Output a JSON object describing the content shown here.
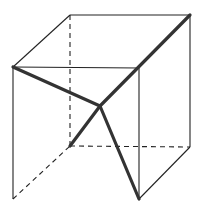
{
  "diagram": {
    "colors": {
      "background": "#ffffff",
      "edge": "#222222",
      "bold": "#333333"
    },
    "vertices": {
      "front_top_left": [
        13,
        67
      ],
      "front_top_right": [
        139,
        68
      ],
      "front_bottom_left": [
        13,
        199
      ],
      "front_bottom_right": [
        139,
        199
      ],
      "back_top_left": [
        70,
        15
      ],
      "back_top_right": [
        190,
        15
      ],
      "back_bottom_left": [
        70,
        146
      ],
      "back_bottom_right": [
        190,
        147
      ],
      "center": [
        100,
        106
      ]
    },
    "solid_edges": [
      [
        "front_top_left",
        "front_top_right"
      ],
      [
        "front_top_left",
        "front_bottom_left"
      ],
      [
        "front_top_right",
        "front_bottom_right"
      ],
      [
        "back_top_left",
        "back_top_right"
      ],
      [
        "back_top_right",
        "back_bottom_right"
      ],
      [
        "front_top_left",
        "back_top_left"
      ],
      [
        "front_bottom_right",
        "back_bottom_right"
      ]
    ],
    "dashed_edges": [
      [
        "back_top_left",
        "back_bottom_left"
      ],
      [
        "back_bottom_left",
        "back_bottom_right"
      ],
      [
        "front_bottom_left",
        "back_bottom_left"
      ]
    ],
    "bold_segments": [
      [
        "front_top_left",
        "center"
      ],
      [
        "back_top_right",
        "center"
      ],
      [
        "center",
        "back_bottom_left"
      ],
      [
        "center",
        "front_bottom_right"
      ]
    ]
  }
}
